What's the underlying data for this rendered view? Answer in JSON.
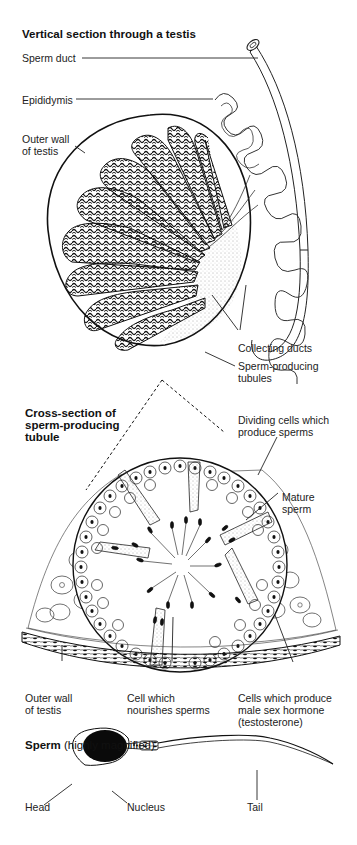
{
  "figure": {
    "section1": {
      "title": "Vertical section through a testis",
      "labels": {
        "sperm_duct": "Sperm duct",
        "epididymis": "Epididymis",
        "outer_wall_line1": "Outer wall",
        "outer_wall_line2": "of testis",
        "collecting_ducts": "Collecting ducts",
        "tubules_line1": "Sperm-producing",
        "tubules_line2": "tubules"
      }
    },
    "section2": {
      "title_line1": "Cross-section of",
      "title_line2": "sperm-producing",
      "title_line3": "tubule",
      "labels": {
        "dividing_line1": "Dividing cells which",
        "dividing_line2": "produce sperms",
        "mature_line1": "Mature",
        "mature_line2": "sperm",
        "outer_wall_line1": "Outer wall",
        "outer_wall_line2": "of testis",
        "nourish_line1": "Cell which",
        "nourish_line2": "nourishes sperms",
        "hormone_line1": "Cells which produce",
        "hormone_line2": "male sex hormone",
        "hormone_line3": "(testosterone)"
      }
    },
    "section3": {
      "title": "Sperm",
      "subtitle": "(highly magnified)",
      "labels": {
        "head": "Head",
        "nucleus": "Nucleus",
        "tail": "Tail"
      }
    }
  }
}
